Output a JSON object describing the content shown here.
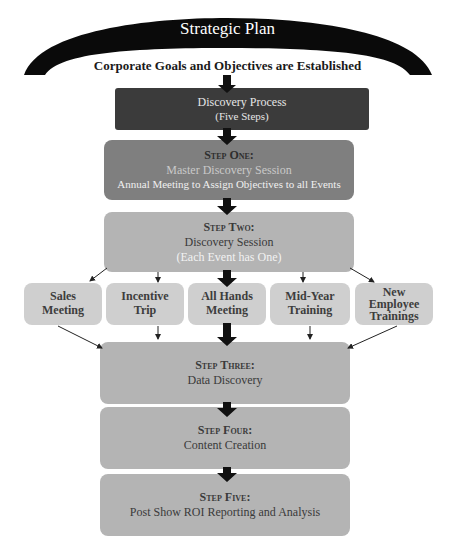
{
  "header": {
    "title": "Strategic Plan",
    "subtitle": "Corporate Goals and Objectives are Established"
  },
  "discovery": {
    "title": "Discovery Process",
    "subtitle": "(Five Steps)"
  },
  "steps": [
    {
      "label": "Step One:",
      "title": "Master Discovery Session",
      "detail": "Annual Meeting to Assign Objectives to all Events"
    },
    {
      "label": "Step Two:",
      "title": "Discovery Session",
      "detail": "(Each Event has One)"
    },
    {
      "label": "Step Three:",
      "title": "Data Discovery"
    },
    {
      "label": "Step Four:",
      "title": "Content Creation"
    },
    {
      "label": "Step Five:",
      "title": "Post Show ROI Reporting and Analysis"
    }
  ],
  "events": [
    {
      "line1": "Sales",
      "line2": "Meeting"
    },
    {
      "line1": "Incentive",
      "line2": "Trip"
    },
    {
      "line1": "All Hands",
      "line2": "Meeting"
    },
    {
      "line1": "Mid-Year",
      "line2": "Training"
    },
    {
      "line1": "New",
      "line2": "Employee",
      "line3": "Trainings"
    }
  ],
  "colors": {
    "arc": "#0a0a0a",
    "discovery_box": "#3b3b3b",
    "step_one_box": "#7f7f7f",
    "step_box": "#b4b4b4",
    "event_box": "#cfcfcf",
    "arrow": "#111111"
  }
}
